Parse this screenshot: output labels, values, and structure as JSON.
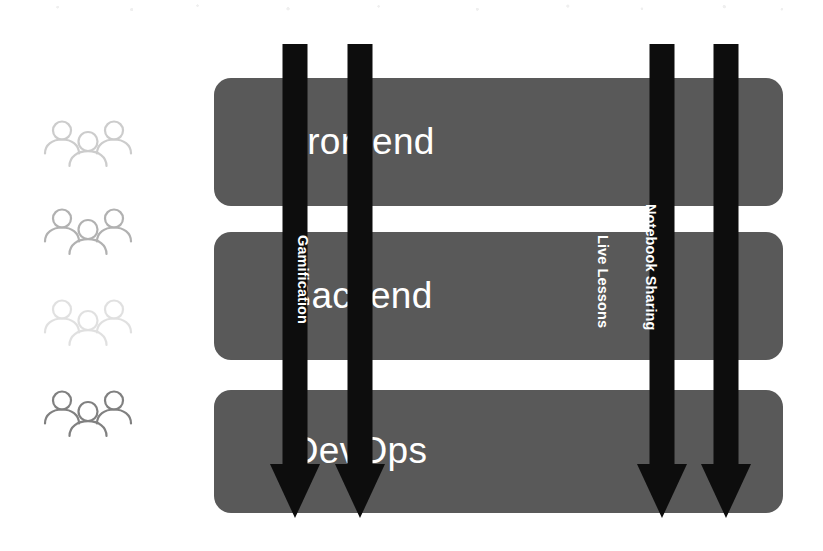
{
  "diagram": {
    "background_color": "#ffffff",
    "layer_color": "#595959",
    "arrow_color": "#0d0d0d",
    "layer_label_color": "#ffffff",
    "arrow_label_color": "#ffffff"
  },
  "layers": [
    {
      "label": "Frontend",
      "top": 78,
      "height": 128
    },
    {
      "label": "Backend",
      "top": 232,
      "height": 128
    },
    {
      "label": "DevOps",
      "top": 390,
      "height": 123
    }
  ],
  "flows": [
    {
      "label": "Data Analytics Visualization",
      "left": 270,
      "label_offset": 104
    },
    {
      "label": "Gamification",
      "left": 335,
      "label_offset": 191
    },
    {
      "label": "Live Lessons",
      "left": 637,
      "label_offset": 191
    },
    {
      "label": "Notebook Sharing",
      "left": 701,
      "label_offset": 160
    }
  ],
  "stakeholders": [
    {
      "icon": "people-group-icon",
      "top": 119,
      "opacity": 0.34
    },
    {
      "icon": "people-group-icon",
      "top": 207,
      "opacity": 0.52
    },
    {
      "icon": "people-group-icon",
      "top": 298,
      "opacity": 0.2
    },
    {
      "icon": "people-group-icon",
      "top": 389,
      "opacity": 0.85
    }
  ]
}
